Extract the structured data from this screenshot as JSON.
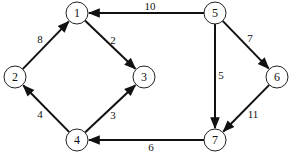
{
  "diagram": {
    "type": "directed-weighted-graph",
    "nodes": [
      {
        "id": "1",
        "label": "1",
        "x": 77,
        "y": 13
      },
      {
        "id": "2",
        "label": "2",
        "x": 15,
        "y": 77
      },
      {
        "id": "3",
        "label": "3",
        "x": 144,
        "y": 77
      },
      {
        "id": "4",
        "label": "4",
        "x": 77,
        "y": 140
      },
      {
        "id": "5",
        "label": "5",
        "x": 215,
        "y": 13
      },
      {
        "id": "6",
        "label": "6",
        "x": 277,
        "y": 77
      },
      {
        "id": "7",
        "label": "7",
        "x": 215,
        "y": 140
      }
    ],
    "edges": [
      {
        "from": "2",
        "to": "1",
        "weight": "8",
        "lx": 40,
        "ly": 39
      },
      {
        "from": "1",
        "to": "3",
        "weight": "2",
        "lx": 113,
        "ly": 40
      },
      {
        "from": "4",
        "to": "2",
        "weight": "4",
        "lx": 40,
        "ly": 114
      },
      {
        "from": "4",
        "to": "3",
        "weight": "3",
        "lx": 113,
        "ly": 115
      },
      {
        "from": "5",
        "to": "1",
        "weight": "10",
        "lx": 150,
        "ly": 6
      },
      {
        "from": "5",
        "to": "7",
        "weight": "5",
        "lx": 221,
        "ly": 75
      },
      {
        "from": "5",
        "to": "6",
        "weight": "7",
        "lx": 250,
        "ly": 38
      },
      {
        "from": "6",
        "to": "7",
        "weight": "11",
        "lx": 253,
        "ly": 114
      },
      {
        "from": "7",
        "to": "4",
        "weight": "6",
        "lx": 151,
        "ly": 147
      }
    ],
    "node_radius": 11,
    "stroke_color": "#111111",
    "background": "#ffffff"
  }
}
